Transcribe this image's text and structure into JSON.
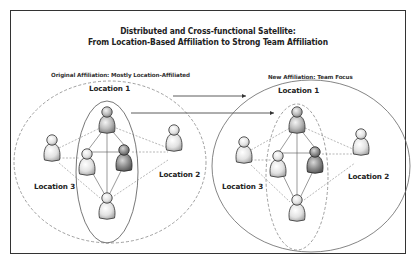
{
  "title": {
    "line1": "Distributed and Cross-functional Satellite:",
    "line2": "From Location-Based Affiliation to Strong Team Affiliation"
  },
  "left_panel": {
    "caption": "Original Affiliation: Mostly Location-Affiliated",
    "labels": {
      "location1": "Location 1",
      "location2": "Location 2",
      "location3": "Location 3"
    },
    "outer_boundary": "dashed",
    "team_boundary": "solid"
  },
  "right_panel": {
    "caption": "New Affiliation: Team Focus",
    "labels": {
      "location1": "Location 1",
      "location2": "Location 2",
      "location3": "Location 3"
    },
    "outer_boundary": "solid",
    "team_boundary": "dashed"
  },
  "colors": {
    "border": "#333333",
    "person_light": "#e6e6e6",
    "person_mid": "#c8c8c8",
    "person_dark": "#8f8f8f",
    "line": "#555555",
    "dashed_line": "#888888"
  }
}
